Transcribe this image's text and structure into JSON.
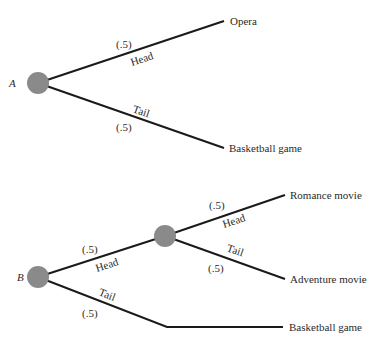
{
  "trees": [
    {
      "name": "A",
      "root_label": "A",
      "branches": [
        {
          "label": "Head",
          "prob": "(.5)",
          "outcome": "Opera"
        },
        {
          "label": "Tail",
          "prob": "(.5)",
          "outcome": "Basketball game"
        }
      ]
    },
    {
      "name": "B",
      "root_label": "B",
      "branches": [
        {
          "label": "Head",
          "prob": "(.5)",
          "sub_branches": [
            {
              "label": "Head",
              "prob": "(.5)",
              "outcome": "Romance movie"
            },
            {
              "label": "Tail",
              "prob": "(.5)",
              "outcome": "Adventure movie"
            }
          ]
        },
        {
          "label": "Tail",
          "prob": "(.5)",
          "outcome": "Basketball game"
        }
      ]
    }
  ],
  "colors": {
    "node": "#8a8a8a",
    "edge": "#1a1a1a",
    "text": "#2a2a2a"
  }
}
